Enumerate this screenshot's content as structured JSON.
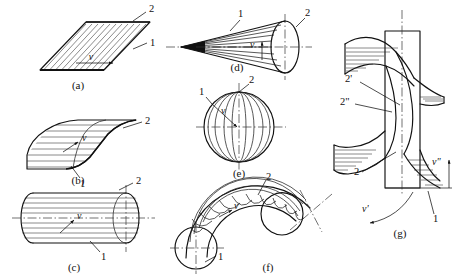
{
  "figure": {
    "background_color": "#ffffff",
    "line_color": "#111111",
    "hatch_color": "#2a2a2a",
    "width": 462,
    "height": 279
  },
  "panels": [
    {
      "id": "a",
      "caption": "(a)",
      "shape": "plane-parallelogram",
      "labels": [
        {
          "text": "2",
          "role": "directrix-label"
        },
        {
          "text": "1",
          "role": "generatrix-label"
        },
        {
          "text": "v",
          "role": "velocity-label"
        }
      ]
    },
    {
      "id": "b",
      "caption": "(b)",
      "shape": "curved-cylindrical-sheet",
      "labels": [
        {
          "text": "2",
          "role": "directrix-label"
        },
        {
          "text": "1",
          "role": "generatrix-label"
        },
        {
          "text": "v",
          "role": "velocity-label"
        }
      ]
    },
    {
      "id": "c",
      "caption": "(c)",
      "shape": "cylinder",
      "labels": [
        {
          "text": "2",
          "role": "directrix-label"
        },
        {
          "text": "1",
          "role": "generatrix-label"
        },
        {
          "text": "v",
          "role": "velocity-label"
        }
      ]
    },
    {
      "id": "d",
      "caption": "(d)",
      "shape": "cone",
      "labels": [
        {
          "text": "1",
          "role": "generatrix-label"
        },
        {
          "text": "2",
          "role": "directrix-label"
        },
        {
          "text": "v",
          "role": "velocity-label"
        }
      ]
    },
    {
      "id": "e",
      "caption": "(e)",
      "shape": "sphere",
      "labels": [
        {
          "text": "1",
          "role": "generatrix-label"
        },
        {
          "text": "2",
          "role": "directrix-label"
        },
        {
          "text": "v",
          "role": "velocity-label"
        }
      ]
    },
    {
      "id": "f",
      "caption": "(f)",
      "shape": "torus-elbow",
      "labels": [
        {
          "text": "2",
          "role": "directrix-label"
        },
        {
          "text": "1",
          "role": "generatrix-label"
        },
        {
          "text": "v",
          "role": "velocity-label"
        }
      ]
    },
    {
      "id": "g",
      "caption": "(g)",
      "shape": "helicoid",
      "labels": [
        {
          "text": "2'",
          "role": "directrix-label-prime"
        },
        {
          "text": "2\"",
          "role": "directrix-label-double-prime"
        },
        {
          "text": "2",
          "role": "directrix-label"
        },
        {
          "text": "1",
          "role": "generatrix-label"
        },
        {
          "text": "v'",
          "role": "rotational-velocity-label"
        },
        {
          "text": "v\"",
          "role": "axial-velocity-label"
        }
      ]
    }
  ],
  "captions": {
    "a": "(a)",
    "b": "(b)",
    "c": "(c)",
    "d": "(d)",
    "e": "(e)",
    "f": "(f)",
    "g": "(g)"
  },
  "numbers": {
    "one": "1",
    "two": "2",
    "two_prime": "2'",
    "two_dprime": "2\""
  },
  "velocity": {
    "v": "v",
    "v_prime": "v'",
    "v_dprime": "v\""
  }
}
